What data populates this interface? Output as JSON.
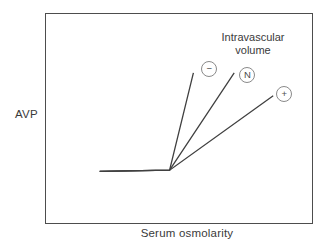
{
  "figure": {
    "annotation": {
      "line1": "Intravascular",
      "line2": "volume"
    }
  },
  "colors": {
    "background": "#ffffff",
    "frame": "#4d4d4d",
    "line": "#404040",
    "text": "#3a3a3a",
    "marker_circle_stroke": "#8a8a8a"
  },
  "chart_data": {
    "type": "line",
    "title": "",
    "xlabel": "Serum osmolarity",
    "ylabel": "AVP",
    "annotation": "Intravascular volume",
    "axes": {
      "numeric_ticks": false,
      "frame": "closed-box",
      "grid": false
    },
    "line_color": "#404040",
    "series": [
      {
        "id": "minus",
        "name": "−",
        "marker": "−",
        "points_frac": [
          [
            0.201,
            0.251
          ],
          [
            0.463,
            0.256
          ],
          [
            0.552,
            0.72
          ]
        ],
        "marker_pos_frac": [
          0.612,
          0.739
        ]
      },
      {
        "id": "normal",
        "name": "N",
        "marker": "N",
        "points_frac": [
          [
            0.201,
            0.251
          ],
          [
            0.463,
            0.256
          ],
          [
            0.705,
            0.72
          ]
        ],
        "marker_pos_frac": [
          0.754,
          0.711
        ]
      },
      {
        "id": "plus",
        "name": "+",
        "marker": "+",
        "points_frac": [
          [
            0.201,
            0.251
          ],
          [
            0.463,
            0.256
          ],
          [
            0.851,
            0.611
          ]
        ],
        "marker_pos_frac": [
          0.892,
          0.621
        ]
      }
    ]
  }
}
